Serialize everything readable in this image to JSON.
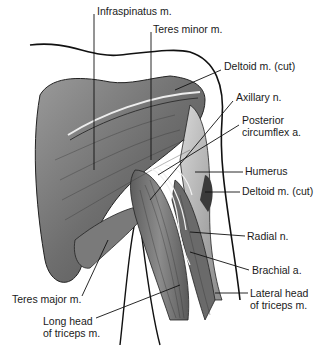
{
  "diagram": {
    "labels": [
      {
        "id": "infraspinatus",
        "text": "Infraspinatus m.",
        "x": 97,
        "y": 11
      },
      {
        "id": "teres-minor",
        "text": "Teres minor m.",
        "x": 153,
        "y": 29
      },
      {
        "id": "deltoid-cut-top",
        "text": "Deltoid m. (cut)",
        "x": 224,
        "y": 66
      },
      {
        "id": "axillary-n",
        "text": "Axillary n.",
        "x": 236,
        "y": 97
      },
      {
        "id": "posterior-circumflex",
        "text": "Posterior",
        "x": 242,
        "y": 120
      },
      {
        "id": "posterior-circumflex-2",
        "text": "circumflex a.",
        "x": 242,
        "y": 132
      },
      {
        "id": "humerus",
        "text": "Humerus",
        "x": 245,
        "y": 166
      },
      {
        "id": "deltoid-cut-lower",
        "text": "Deltoid m. (cut)",
        "x": 242,
        "y": 186
      },
      {
        "id": "radial-n",
        "text": "Radial n.",
        "x": 247,
        "y": 230
      },
      {
        "id": "brachial-a",
        "text": "Brachial a.",
        "x": 252,
        "y": 264
      },
      {
        "id": "lateral-head",
        "text": "Lateral head",
        "x": 250,
        "y": 287
      },
      {
        "id": "lateral-head-2",
        "text": "of triceps m.",
        "x": 250,
        "y": 299
      },
      {
        "id": "teres-major",
        "text": "Teres major m.",
        "x": 12,
        "y": 293
      },
      {
        "id": "long-head",
        "text": "Long head",
        "x": 43,
        "y": 315
      },
      {
        "id": "long-head-2",
        "text": "of triceps m.",
        "x": 43,
        "y": 327
      }
    ]
  },
  "colors": {
    "muscle_dark": "#5a5a5a",
    "muscle_mid": "#8a8a8a",
    "muscle_light": "#c8c8c8",
    "outline": "#111111",
    "text": "#1a1a1a"
  }
}
